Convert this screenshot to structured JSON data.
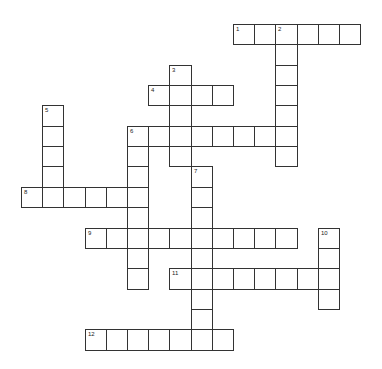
{
  "puzzle": {
    "type": "crossword",
    "grid": {
      "origin_x": 21,
      "origin_y": 24,
      "cell_w": 21.2,
      "cell_h": 20.35,
      "border_color": "#333333",
      "cell_color": "#ffffff"
    },
    "entries": [
      {
        "number": "1",
        "direction": "across",
        "row": 0,
        "col": 10,
        "length": 6
      },
      {
        "number": "2",
        "direction": "down",
        "row": 0,
        "col": 12,
        "length": 7
      },
      {
        "number": "3",
        "direction": "down",
        "row": 2,
        "col": 7,
        "length": 5
      },
      {
        "number": "4",
        "direction": "across",
        "row": 3,
        "col": 6,
        "length": 4
      },
      {
        "number": "5",
        "direction": "down",
        "row": 4,
        "col": 1,
        "length": 5
      },
      {
        "number": "6",
        "direction": "across",
        "row": 5,
        "col": 5,
        "length": 8
      },
      {
        "number": "6",
        "direction": "down",
        "row": 5,
        "col": 5,
        "length": 8
      },
      {
        "number": "7",
        "direction": "down",
        "row": 7,
        "col": 8,
        "length": 9
      },
      {
        "number": "8",
        "direction": "across",
        "row": 8,
        "col": 0,
        "length": 6
      },
      {
        "number": "9",
        "direction": "across",
        "row": 10,
        "col": 3,
        "length": 10
      },
      {
        "number": "10",
        "direction": "down",
        "row": 10,
        "col": 14,
        "length": 4
      },
      {
        "number": "11",
        "direction": "across",
        "row": 12,
        "col": 7,
        "length": 8
      },
      {
        "number": "12",
        "direction": "across",
        "row": 15,
        "col": 3,
        "length": 7
      }
    ]
  }
}
